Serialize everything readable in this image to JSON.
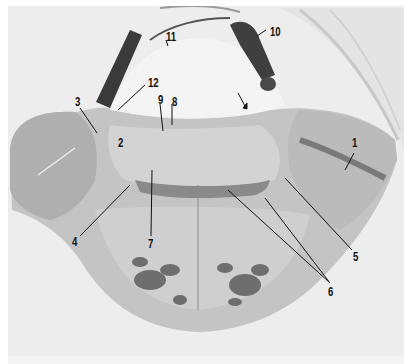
{
  "figure": {
    "labels": [
      {
        "id": "1",
        "text": "1",
        "x": 352,
        "y": 137
      },
      {
        "id": "2",
        "text": "2",
        "x": 118,
        "y": 137
      },
      {
        "id": "3",
        "text": "3",
        "x": 72,
        "y": 96
      },
      {
        "id": "4",
        "text": "4",
        "x": 71,
        "y": 236
      },
      {
        "id": "5",
        "text": "5",
        "x": 351,
        "y": 249
      },
      {
        "id": "6",
        "text": "6",
        "x": 325,
        "y": 283
      },
      {
        "id": "7",
        "text": "7",
        "x": 146,
        "y": 236
      },
      {
        "id": "8",
        "text": "8",
        "x": 169,
        "y": 95
      },
      {
        "id": "9",
        "text": "9",
        "x": 155,
        "y": 92
      },
      {
        "id": "10",
        "text": "10",
        "x": 268,
        "y": 26
      },
      {
        "id": "11",
        "text": "11",
        "x": 165,
        "y": 31
      },
      {
        "id": "12",
        "text": "12",
        "x": 145,
        "y": 77
      }
    ],
    "arrow": {
      "description": "unlabeled arrow pointing down-right into fourth ventricle floor",
      "x": 238,
      "y": 95
    },
    "colors": {
      "background": "#ffffff",
      "plate": "#ededed",
      "tissue_light": "#c9c9c9",
      "tissue_mid": "#a8a8a8",
      "tissue_dark": "#555555",
      "label": "#111111"
    }
  }
}
